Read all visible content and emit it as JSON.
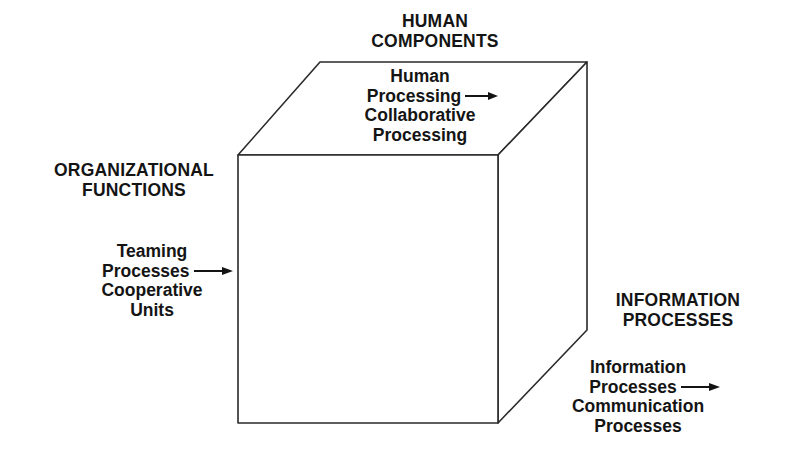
{
  "diagram": {
    "type": "3d-cube-taxonomy",
    "axes": {
      "top": {
        "heading": [
          "HUMAN",
          "COMPONENTS"
        ],
        "progression": [
          "Human",
          "Processing",
          "Collaborative",
          "Processing"
        ],
        "arrow": "right-arrow"
      },
      "left": {
        "heading": [
          "ORGANIZATIONAL",
          "FUNCTIONS"
        ],
        "progression": [
          "Teaming",
          "Processes",
          "Cooperative",
          "Units"
        ],
        "arrow": "right-arrow"
      },
      "right": {
        "heading": [
          "INFORMATION",
          "PROCESSES"
        ],
        "progression": [
          "Information",
          "Processes",
          "Communication",
          "Processes"
        ],
        "arrow": "right-arrow"
      }
    },
    "colors": {
      "stroke": "#2a2a2a",
      "text": "#141414",
      "background": "#ffffff"
    }
  }
}
